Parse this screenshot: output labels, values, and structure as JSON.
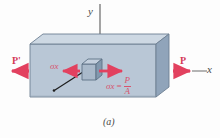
{
  "figure": {
    "caption": "(a)",
    "axes": {
      "y_label": "y",
      "x_label": "x"
    },
    "forces": {
      "left_label": "P'",
      "right_label": "P"
    },
    "stress": {
      "left_label": "σx",
      "equation_symbol": "σx",
      "equation_operator": "=",
      "equation_numerator": "P",
      "equation_denominator": "A"
    },
    "colors": {
      "front_face": "#b9c7d6",
      "top_face": "#cdd8e3",
      "right_face": "#90a4ba",
      "outline": "#6d7f92",
      "force_red": "#e2415f",
      "axis_gray": "#8d8d8d",
      "leader_black": "#1d1d1d",
      "background": "#fdfdfd"
    },
    "elements": {
      "prism_name": "rectangular-prism-bar",
      "stress_cube_name": "stress-element-cube",
      "leader_name": "leader-line"
    }
  }
}
